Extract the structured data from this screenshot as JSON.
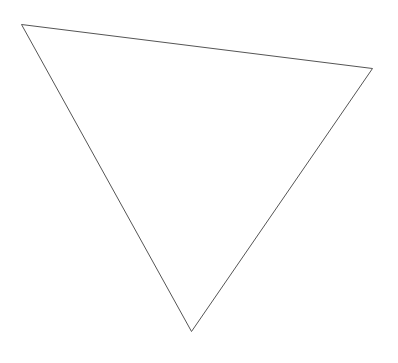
{
  "diagram": {
    "shape": "triangle",
    "stroke_color": "#555555",
    "fill_color": "none",
    "stroke_width": 1,
    "vertices": [
      {
        "x": 21,
        "y": 24
      },
      {
        "x": 372,
        "y": 68
      },
      {
        "x": 191,
        "y": 331
      }
    ]
  }
}
